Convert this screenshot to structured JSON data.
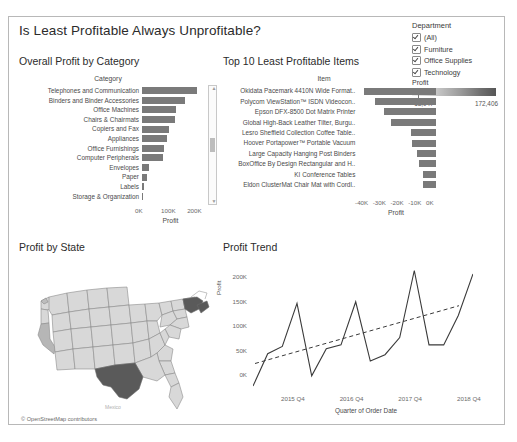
{
  "dashboard": {
    "title": "Is Least Profitable Always Unprofitable?"
  },
  "department_filter": {
    "title": "Department",
    "items": [
      {
        "label": "(All)",
        "checked": true
      },
      {
        "label": "Furniture",
        "checked": true
      },
      {
        "label": "Office Supplies",
        "checked": true
      },
      {
        "label": "Technology",
        "checked": true
      }
    ]
  },
  "profit_legend": {
    "title": "Profit",
    "min": "-18,047",
    "max": "172,406"
  },
  "panels": {
    "overall_profit": "Overall Profit by Category",
    "least_profitable": "Top 10 Least Profitable Items",
    "profit_by_state": "Profit by State",
    "profit_trend": "Profit Trend"
  },
  "map": {
    "attribution": "© OpenStreetMap contributors",
    "mexico_label": "Mexico"
  },
  "chart_data": [
    {
      "type": "bar",
      "title": "Overall Profit by Category",
      "orientation": "horizontal",
      "column_header": "Category",
      "xlabel": "Profit",
      "ylabel": "Category",
      "xlim": [
        0,
        230000
      ],
      "ticks": [
        "0K",
        "100K",
        "200K"
      ],
      "tick_values": [
        0,
        100000,
        200000
      ],
      "grid": false,
      "categories": [
        "Telephones and Communication",
        "Binders and Binder Accessories",
        "Office Machines",
        "Chairs & Chairmats",
        "Copiers and Fax",
        "Appliances",
        "Office Furnishings",
        "Computer Peripherals",
        "Envelopes",
        "Paper",
        "Labels",
        "Storage & Organization"
      ],
      "values": [
        210000,
        165000,
        132000,
        128000,
        102000,
        96000,
        84000,
        80000,
        28000,
        20000,
        8000,
        3000
      ]
    },
    {
      "type": "bar",
      "title": "Top 10 Least Profitable Items",
      "orientation": "horizontal",
      "column_header": "Item",
      "xlabel": "Profit",
      "ylabel": "Item",
      "xlim": [
        -44000,
        0
      ],
      "ticks": [
        "-40K",
        "-30K",
        "-20K",
        "-10K",
        "0K"
      ],
      "tick_values": [
        -40000,
        -30000,
        -20000,
        -10000,
        0
      ],
      "grid": false,
      "categories": [
        "Okidata Pacemark 4410N Wide Format..",
        "Polycom ViewStation™ ISDN Videocon..",
        "Epson DFX-8500 Dot Matrix Printer",
        "Global High-Back Leather Tilter, Burgu..",
        "Lesro Sheffield Collection Coffee Table..",
        "Hoover Portapower™ Portable Vacuum",
        "Large Capacity Hanging Post Binders",
        "BoxOffice By Design Rectangular and H..",
        "KI Conference Tables",
        "Eldon ClusterMat Chair Mat with Cordl.."
      ],
      "values": [
        -40700,
        -34400,
        -29200,
        -25200,
        -14200,
        -13600,
        -10500,
        -9800,
        -7500,
        -7100
      ]
    },
    {
      "type": "map",
      "title": "Profit by State",
      "highlighted_states": [
        "Texas",
        "New York",
        "Washington",
        "California",
        "Oregon"
      ],
      "attribution": "© OpenStreetMap contributors"
    },
    {
      "type": "line",
      "title": "Profit Trend",
      "xlabel": "Quarter of Order Date",
      "ylabel": "Profit",
      "ylim": [
        -30000,
        215000
      ],
      "yticks": [
        "0K",
        "50K",
        "100K",
        "150K",
        "200K"
      ],
      "ytick_values": [
        0,
        50000,
        100000,
        150000,
        200000
      ],
      "xticks": [
        "2015 Q4",
        "2016 Q4",
        "2017 Q4",
        "2018 Q4"
      ],
      "grid": false,
      "series": [
        {
          "name": "Profit",
          "x": [
            "2015 Q1",
            "2015 Q2",
            "2015 Q3",
            "2015 Q4",
            "2016 Q1",
            "2016 Q2",
            "2016 Q3",
            "2016 Q4",
            "2017 Q1",
            "2017 Q2",
            "2017 Q3",
            "2017 Q4",
            "2018 Q1",
            "2018 Q2",
            "2018 Q3",
            "2018 Q4"
          ],
          "values": [
            -24000,
            42000,
            57000,
            145000,
            -3000,
            52000,
            60000,
            148000,
            27000,
            40000,
            75000,
            212000,
            60000,
            60000,
            120000,
            205000
          ]
        },
        {
          "name": "Trend",
          "style": "dashed",
          "x": [
            "2015 Q1",
            "2018 Q4"
          ],
          "values": [
            22000,
            140000
          ]
        }
      ]
    }
  ]
}
